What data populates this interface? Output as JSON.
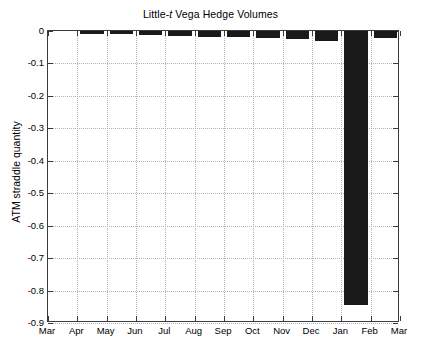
{
  "chart_data": {
    "type": "bar",
    "title": "Little-t Vega Hedge Volumes",
    "title_prefix": "Little-",
    "title_italic": "t",
    "title_suffix": " Vega Hedge Volumes",
    "xlabel": "",
    "ylabel": "ATM straddle quantity",
    "categories": [
      "Apr",
      "May",
      "Jun",
      "Jul",
      "Aug",
      "Sep",
      "Oct",
      "Nov",
      "Dec",
      "Jan",
      "Feb"
    ],
    "values": [
      -0.008,
      -0.01,
      -0.012,
      -0.014,
      -0.017,
      -0.019,
      -0.022,
      -0.025,
      -0.03,
      -0.845,
      -0.022
    ],
    "xtick_labels": [
      "Mar",
      "Apr",
      "May",
      "Jun",
      "Jul",
      "Aug",
      "Sep",
      "Oct",
      "Nov",
      "Dec",
      "Jan",
      "Feb",
      "Mar"
    ],
    "ytick_labels": [
      "0",
      "-0.1",
      "-0.2",
      "-0.3",
      "-0.4",
      "-0.5",
      "-0.6",
      "-0.7",
      "-0.8",
      "-0.9"
    ],
    "ytick_values": [
      0,
      -0.1,
      -0.2,
      -0.3,
      -0.4,
      -0.5,
      -0.6,
      -0.7,
      -0.8,
      -0.9
    ],
    "ylim": [
      -0.9,
      0
    ],
    "xlim": [
      0,
      13
    ],
    "grid": true,
    "legend": null,
    "bar_color": "#1a1a1a",
    "grid_color": "#b4b4b4",
    "axis_color": "#3a3a3a",
    "background": "#ffffff"
  }
}
